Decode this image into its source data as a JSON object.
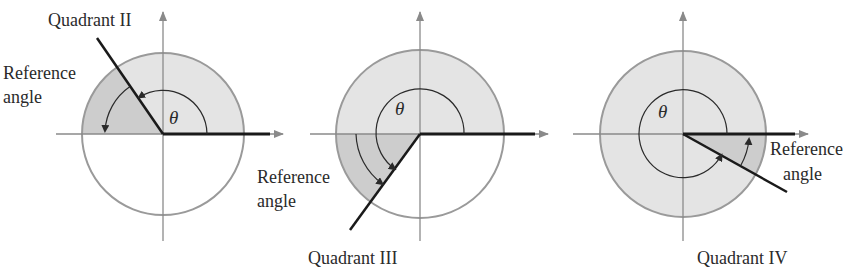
{
  "colors": {
    "fill": "#e4e4e4",
    "reference_fill": "#cdcdcd",
    "circle_stroke": "#9a9a9a",
    "axis": "#8a8a8a",
    "ray": "#1a1a1a",
    "text": "#2a2a2a"
  },
  "figures": [
    {
      "quadrant_label": "Quadrant II",
      "reference_label_line1": "Reference",
      "reference_label_line2": "angle",
      "theta": "θ"
    },
    {
      "quadrant_label": "Quadrant III",
      "reference_label_line1": "Reference",
      "reference_label_line2": "angle",
      "theta": "θ"
    },
    {
      "quadrant_label": "Quadrant IV",
      "reference_label_line1": "Reference",
      "reference_label_line2": "angle",
      "theta": "θ"
    }
  ]
}
